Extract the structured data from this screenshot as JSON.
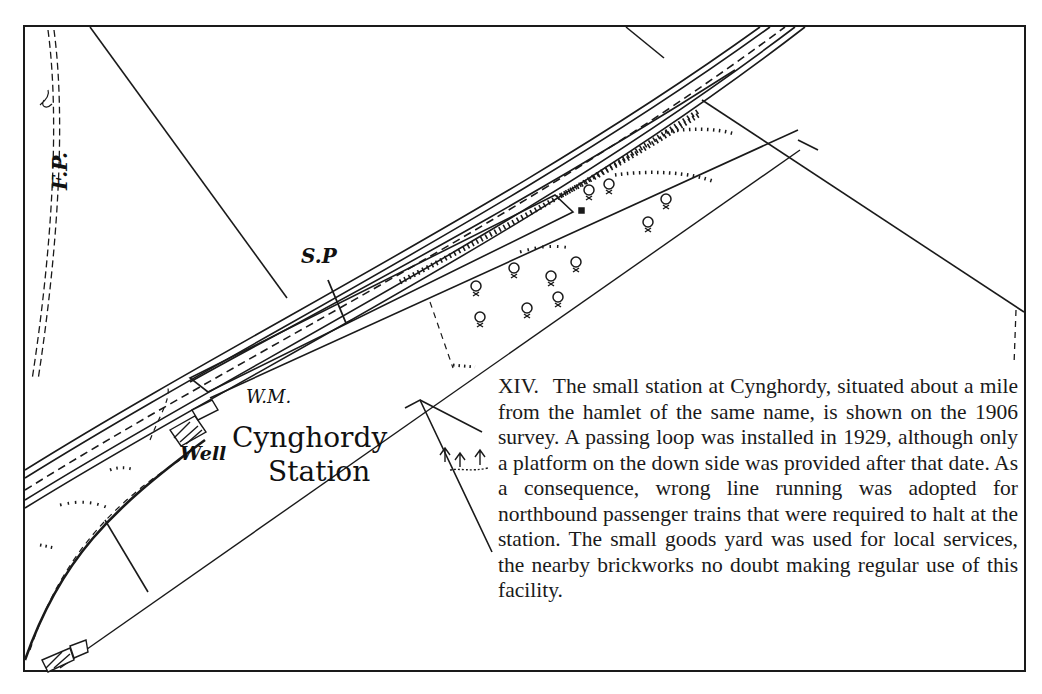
{
  "map": {
    "labels": {
      "footpath": "F.P.",
      "signal_post": "S.P",
      "weighing_machine": "W.M.",
      "well": "Well",
      "station_name_line1": "Cynghordy",
      "station_name_line2": "Station"
    },
    "symbols": [
      "railway-tracks",
      "platform",
      "trees",
      "coniferous-wood",
      "buildings",
      "footpath",
      "field-boundaries",
      "embankment-hachures"
    ],
    "colors": {
      "ink": "#1a1a1a",
      "paper": "#ffffff"
    }
  },
  "caption": {
    "number": "XIV.",
    "text": "The small station at Cynghordy, situated about a mile from the hamlet of the same name, is shown on the 1906 survey. A passing loop was installed in 1929, although only a platform on the down side was provided after that date. As a consequence, wrong line running was adopted for northbound passenger trains that were required to halt at the station. The small goods yard was used for local services, the nearby brickworks no doubt making regular use of this facility."
  }
}
